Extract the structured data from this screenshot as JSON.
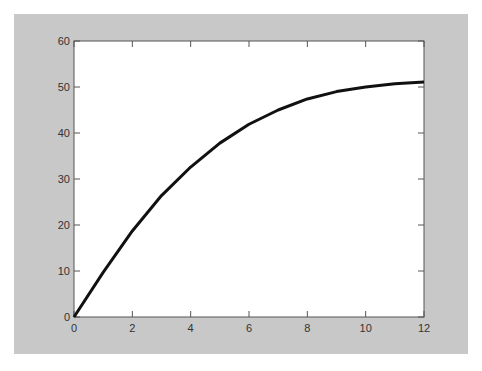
{
  "chart_data": {
    "type": "line",
    "title": "",
    "xlabel": "",
    "ylabel": "",
    "xlim": [
      0,
      12
    ],
    "ylim": [
      0,
      60
    ],
    "grid": false,
    "x_ticks": [
      "0",
      "2",
      "4",
      "6",
      "8",
      "10",
      "12"
    ],
    "y_ticks": [
      "0",
      "10",
      "20",
      "30",
      "40",
      "50",
      "60"
    ],
    "series": [
      {
        "name": "curve",
        "color": "#111111",
        "x": [
          0,
          1,
          2,
          3,
          4,
          5,
          6,
          7,
          8,
          9,
          10,
          11,
          12
        ],
        "values": [
          0,
          9.7,
          18.7,
          26.4,
          32.6,
          37.8,
          41.9,
          45.0,
          47.4,
          49.0,
          50.0,
          50.7,
          51.1
        ]
      }
    ]
  }
}
